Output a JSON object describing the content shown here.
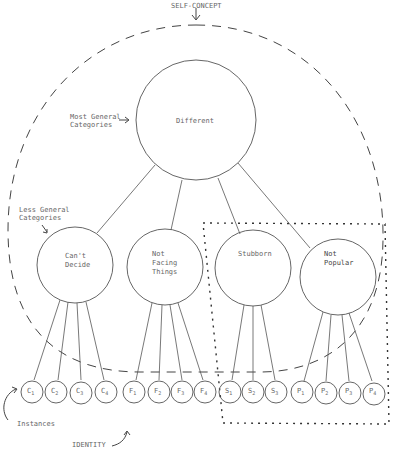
{
  "annotations": {
    "self_concept": "SELF-CONCEPT",
    "most_general_line1": "Most General",
    "most_general_line2": "Categories",
    "less_general_line1": "Less General",
    "less_general_line2": "Categories",
    "instances": "Instances",
    "identity": "IDENTITY"
  },
  "root": {
    "label": "Different"
  },
  "categories": [
    {
      "line1": "Can't",
      "line2": "Decide",
      "line3": ""
    },
    {
      "line1": "Not",
      "line2": "Facing",
      "line3": "Things"
    },
    {
      "line1": "Stubborn",
      "line2": "",
      "line3": ""
    },
    {
      "line1": "Not",
      "line2": "Popular",
      "line3": ""
    }
  ],
  "instances": [
    {
      "label": "C",
      "sub": "1"
    },
    {
      "label": "C",
      "sub": "2"
    },
    {
      "label": "C",
      "sub": "3"
    },
    {
      "label": "C",
      "sub": "4"
    },
    {
      "label": "F",
      "sub": "1"
    },
    {
      "label": "F",
      "sub": "2"
    },
    {
      "label": "F",
      "sub": "3"
    },
    {
      "label": "F",
      "sub": "4"
    },
    {
      "label": "S",
      "sub": "1"
    },
    {
      "label": "S",
      "sub": "2"
    },
    {
      "label": "S",
      "sub": "3"
    },
    {
      "label": "P",
      "sub": "1"
    },
    {
      "label": "P",
      "sub": "2"
    },
    {
      "label": "P",
      "sub": "3"
    },
    {
      "label": "P",
      "sub": "4"
    }
  ]
}
